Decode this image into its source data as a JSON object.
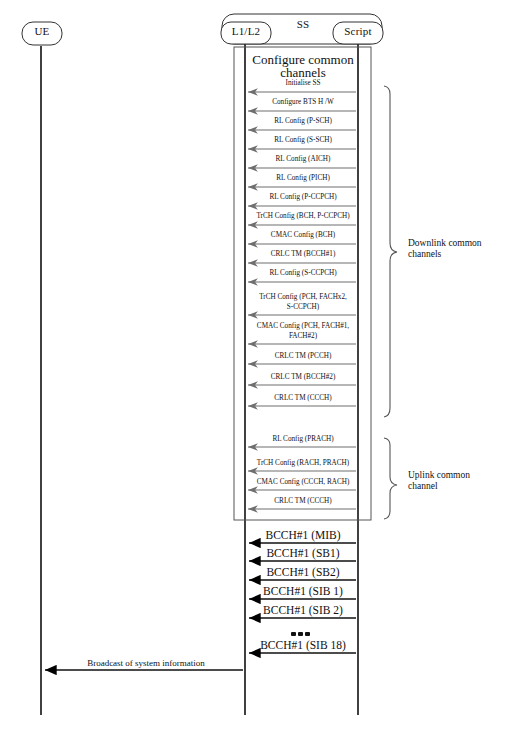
{
  "diagram": {
    "type": "uml-sequence-diagram",
    "title": "Configure common channels",
    "line_color": "#000000",
    "arrow_color": "#6b6b6b",
    "background": "#ffffff"
  },
  "actors": [
    {
      "id": "ue",
      "label": "UE",
      "x": 41
    },
    {
      "id": "l1l2",
      "label": "L1/L2",
      "x": 245
    },
    {
      "id": "script",
      "label": "Script",
      "x": 358
    }
  ],
  "system_box": {
    "label": "SS"
  },
  "frame": {
    "title_line1": "Configure common",
    "title_line2": "channels"
  },
  "messages": [
    {
      "label": "Initialise SS",
      "size": "small",
      "y": 92
    },
    {
      "label": "Configure BTS H /W",
      "size": "small",
      "y": 111
    },
    {
      "label": "RL Config (P-SCH)",
      "size": "small",
      "y": 130
    },
    {
      "label": "RL Config (S-SCH)",
      "size": "small",
      "y": 149
    },
    {
      "label": "RL Config (AICH)",
      "size": "small",
      "y": 168
    },
    {
      "label": "RL Config (PICH)",
      "size": "small",
      "y": 187
    },
    {
      "label": "RL Config (P-CCPCH)",
      "size": "small",
      "y": 206
    },
    {
      "label": "TrCH Config (BCH, P-CCPCH)",
      "size": "small",
      "y": 225
    },
    {
      "label": "CMAC Config (BCH)",
      "size": "small",
      "y": 244
    },
    {
      "label": "CRLC TM (BCCH#1)",
      "size": "small",
      "y": 263
    },
    {
      "label": "RL Config (S-CCPCH)",
      "size": "small",
      "y": 282
    },
    {
      "label": "TrCH Config (PCH, FACHx2,",
      "label2": "S-CCPCH)",
      "size": "small",
      "y": 308
    },
    {
      "label": "CMAC Config (PCH, FACH#1,",
      "label2": "FACH#2)",
      "size": "small",
      "y": 337
    },
    {
      "label": "CRLC TM (PCCH)",
      "size": "small",
      "y": 364
    },
    {
      "label": "CRLC TM (BCCH#2)",
      "size": "small",
      "y": 385
    },
    {
      "label": "CRLC TM (CCCH)",
      "size": "small",
      "y": 406
    },
    {
      "label": "RL Config (PRACH)",
      "size": "small",
      "y": 447
    },
    {
      "label": "TrCH Config (RACH, PRACH)",
      "size": "small",
      "y": 471
    },
    {
      "label": "CMAC Config (CCCH, RACH)",
      "size": "small",
      "y": 490
    },
    {
      "label": "CRLC TM (CCCH)",
      "size": "small",
      "y": 509
    }
  ],
  "broadcast_messages": [
    {
      "label": "BCCH#1 (MIB)",
      "size": "big",
      "y": 543
    },
    {
      "label": "BCCH#1 (SB1)",
      "size": "big",
      "y": 561
    },
    {
      "label": "BCCH#1 (SB2)",
      "size": "big",
      "y": 580
    },
    {
      "label": "BCCH#1 (SIB 1)",
      "size": "big",
      "y": 599
    },
    {
      "label": "BCCH#1 (SIB 2)",
      "size": "big",
      "y": 618
    },
    {
      "label": "BCCH#1 (SIB 18)",
      "size": "big",
      "y": 653
    }
  ],
  "ellipsis": {
    "label": "•••",
    "x": 300,
    "y": 636
  },
  "final_message": {
    "label": "Broadcast of system information",
    "y": 670
  },
  "brackets": [
    {
      "id": "downlink",
      "label_line1": "Downlink common",
      "label_line2": "channels",
      "top": 85,
      "bottom": 417
    },
    {
      "id": "uplink",
      "label_line1": "Uplink common",
      "label_line2": "channel",
      "top": 437,
      "bottom": 519
    }
  ]
}
